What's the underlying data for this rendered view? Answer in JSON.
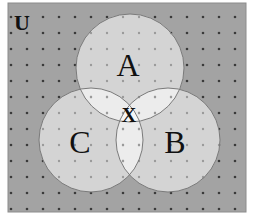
{
  "diagram": {
    "type": "venn",
    "universe": {
      "label": "U",
      "frame": {
        "x": 8,
        "y": 3,
        "width": 238,
        "height": 209
      },
      "fill": "#a3a3a3",
      "border": "#8c8c8c"
    },
    "grid": {
      "spacing": 16,
      "offset_x": 3,
      "offset_y": 9,
      "dot_color_outside": "#3a3a3a",
      "dot_color_inside": "#9a9a9a"
    },
    "sets": [
      {
        "id": "A",
        "label": "A",
        "cx": 130,
        "cy": 68,
        "r": 54
      },
      {
        "id": "B",
        "label": "B",
        "cx": 168,
        "cy": 140,
        "r": 52
      },
      {
        "id": "C",
        "label": "C",
        "cx": 91,
        "cy": 140,
        "r": 52
      }
    ],
    "colors": {
      "circle_fill": "#d4d4d4",
      "pair_overlap_fill": "#ececec",
      "triple_overlap_fill": "#f6f6f6",
      "circle_stroke": "#7a7a7a"
    },
    "region_label": {
      "text": "X",
      "region": "A ∩ B ∩ C"
    },
    "labels": {
      "universe": "U",
      "A": "A",
      "B": "B",
      "C": "C",
      "X": "X"
    }
  }
}
